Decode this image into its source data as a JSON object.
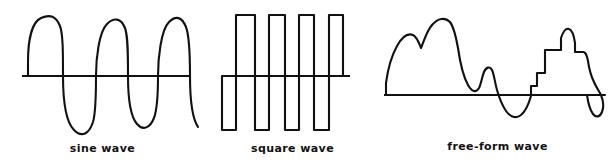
{
  "figure": {
    "background_color": "#ffffff",
    "stroke_color": "#111111"
  },
  "panels": [
    {
      "id": "sine",
      "caption": "sine wave",
      "axis": {
        "x1": 22,
        "x2": 190,
        "y": 76
      },
      "path": "M 28,76 L 28,62 C 28,40 32,22 41,18 C 50,14 56,16 60,26 C 63,34 63,52 63,76 C 63,100 66,122 74,130 C 82,138 89,134 93,122 C 96,112 96,94 96,76 C 96,58 99,32 107,24 C 114,17 121,18 125,28 C 128,36 128,54 128,76 C 128,98 130,116 137,124 C 143,131 150,128 154,118 C 157,110 158,92 158,76 C 158,58 161,30 169,22 C 176,15 182,17 186,27 C 189,35 190,54 190,76 C 190,98 192,118 198,127"
    },
    {
      "id": "square",
      "caption": "square wave",
      "axis": {
        "x1": 17,
        "x2": 145,
        "y": 76
      },
      "path": "M 17,76 L 17,130 L 31,130 L 31,15 L 50,15 L 50,130 L 64,130 L 64,15 L 80,15 L 80,130 L 94,130 L 94,15 L 109,15 L 109,130 L 124,130 L 124,15 L 138,15 L 138,76"
    },
    {
      "id": "free",
      "caption": "free-form wave",
      "axis": {
        "x1": 4,
        "x2": 225,
        "y": 95
      },
      "path": "M 6,95 L 6,83 C 8,68 12,55 17,46 C 22,37 28,33 33,35 C 37,37 39,43 41,48 C 43,44 46,32 52,25 C 58,18 65,17 70,22 C 74,27 76,37 78,48 C 80,62 83,76 88,85 C 92,92 96,93 99,88 C 101,84 102,77 104,72 C 106,67 110,66 112,70 C 114,74 115,83 117,90 C 119,97 122,105 126,111 C 130,117 136,119 141,115 C 146,111 149,103 151,96 L 151,86 L 157,86 L 157,73 L 165,73 L 165,50 L 181,50 L 181,38 C 183,32 186,28 189,29 C 192,30 194,36 195,43 L 195,52 L 203,52 C 206,52 207,56 208,61 C 209,68 211,76 214,82 C 216,87 219,91 221,95 C 223,100 224,107 222,112 C 220,117 216,118 213,114 C 210,110 208,102 207,95 L 225,95"
    }
  ]
}
